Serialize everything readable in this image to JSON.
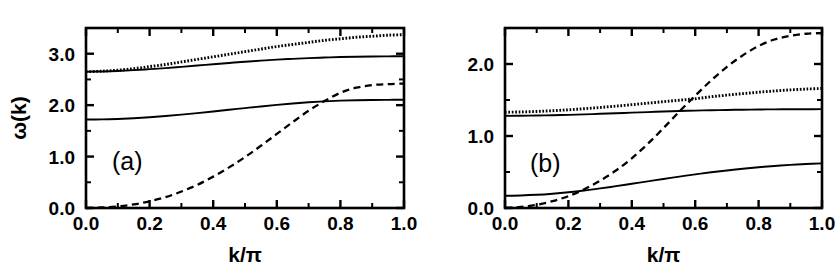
{
  "figure": {
    "background_color": "#ffffff",
    "ink_color": "#000000",
    "width": 840,
    "height": 275
  },
  "chart_data": [
    {
      "type": "line",
      "panel_label": "(a)",
      "title": "",
      "xlabel": "k/π",
      "ylabel": "ω(k)",
      "xlim": [
        0.0,
        1.0
      ],
      "ylim": [
        0.0,
        3.5
      ],
      "grid": false,
      "legend": "none",
      "xticks": [
        0.0,
        0.2,
        0.4,
        0.6,
        0.8,
        1.0
      ],
      "xticklabels": [
        "0.0",
        "0.2",
        "0.4",
        "0.6",
        "0.8",
        "1.0"
      ],
      "xminorticks": [
        0.1,
        0.3,
        0.5,
        0.7,
        0.9
      ],
      "yticks": [
        0.0,
        1.0,
        2.0,
        3.0
      ],
      "yticklabels": [
        "0.0",
        "1.0",
        "2.0",
        "3.0"
      ],
      "yminorticks": [
        0.5,
        1.5,
        2.5,
        3.5
      ],
      "x": [
        0.0,
        0.05,
        0.1,
        0.15,
        0.2,
        0.25,
        0.3,
        0.35,
        0.4,
        0.45,
        0.5,
        0.55,
        0.6,
        0.65,
        0.7,
        0.75,
        0.8,
        0.85,
        0.9,
        0.95,
        1.0
      ],
      "series": [
        {
          "name": "upper-dotted-branch",
          "style": "dotted",
          "values": [
            2.65,
            2.66,
            2.68,
            2.71,
            2.75,
            2.79,
            2.84,
            2.89,
            2.94,
            2.99,
            3.04,
            3.09,
            3.14,
            3.18,
            3.22,
            3.26,
            3.29,
            3.32,
            3.34,
            3.36,
            3.37
          ]
        },
        {
          "name": "upper-solid-branch",
          "style": "solid",
          "values": [
            2.65,
            2.655,
            2.665,
            2.68,
            2.7,
            2.72,
            2.745,
            2.77,
            2.795,
            2.82,
            2.845,
            2.865,
            2.885,
            2.9,
            2.915,
            2.925,
            2.935,
            2.942,
            2.947,
            2.949,
            2.95
          ]
        },
        {
          "name": "lower-solid-branch",
          "style": "solid",
          "values": [
            1.72,
            1.723,
            1.732,
            1.746,
            1.765,
            1.788,
            1.815,
            1.845,
            1.877,
            1.91,
            1.943,
            1.975,
            2.005,
            2.032,
            2.055,
            2.073,
            2.087,
            2.096,
            2.101,
            2.103,
            2.104
          ]
        },
        {
          "name": "dashed-dispersion-branch",
          "style": "dashed",
          "values": [
            0.0,
            0.01,
            0.03,
            0.07,
            0.13,
            0.21,
            0.32,
            0.45,
            0.61,
            0.79,
            0.99,
            1.21,
            1.44,
            1.67,
            1.89,
            2.08,
            2.24,
            2.34,
            2.39,
            2.41,
            2.42
          ]
        }
      ]
    },
    {
      "type": "line",
      "panel_label": "(b)",
      "title": "",
      "xlabel": "k/π",
      "ylabel": "",
      "xlim": [
        0.0,
        1.0
      ],
      "ylim": [
        0.0,
        2.5
      ],
      "grid": false,
      "legend": "none",
      "xticks": [
        0.0,
        0.2,
        0.4,
        0.6,
        0.8,
        1.0
      ],
      "xticklabels": [
        "0.0",
        "0.2",
        "0.4",
        "0.6",
        "0.8",
        "1.0"
      ],
      "xminorticks": [
        0.1,
        0.3,
        0.5,
        0.7,
        0.9
      ],
      "yticks": [
        0.0,
        1.0,
        2.0
      ],
      "yticklabels": [
        "0.0",
        "1.0",
        "2.0"
      ],
      "yminorticks": [
        0.5,
        1.5,
        2.5
      ],
      "x": [
        0.0,
        0.05,
        0.1,
        0.15,
        0.2,
        0.25,
        0.3,
        0.35,
        0.4,
        0.45,
        0.5,
        0.55,
        0.6,
        0.65,
        0.7,
        0.75,
        0.8,
        0.85,
        0.9,
        0.95,
        1.0
      ],
      "series": [
        {
          "name": "upper-dotted-branch",
          "style": "dotted",
          "values": [
            1.33,
            1.334,
            1.341,
            1.351,
            1.364,
            1.379,
            1.396,
            1.415,
            1.435,
            1.456,
            1.477,
            1.497,
            1.517,
            1.545,
            1.568,
            1.589,
            1.608,
            1.625,
            1.64,
            1.652,
            1.66
          ]
        },
        {
          "name": "flat-solid-branch",
          "style": "solid",
          "values": [
            1.28,
            1.281,
            1.284,
            1.288,
            1.294,
            1.3,
            1.308,
            1.316,
            1.324,
            1.332,
            1.34,
            1.347,
            1.353,
            1.358,
            1.362,
            1.365,
            1.368,
            1.37,
            1.371,
            1.372,
            1.373
          ]
        },
        {
          "name": "lower-solid-branch",
          "style": "solid",
          "values": [
            0.17,
            0.174,
            0.183,
            0.198,
            0.218,
            0.243,
            0.272,
            0.303,
            0.336,
            0.37,
            0.403,
            0.436,
            0.467,
            0.496,
            0.521,
            0.545,
            0.566,
            0.584,
            0.599,
            0.611,
            0.62
          ]
        },
        {
          "name": "dashed-dispersion-branch",
          "style": "dashed",
          "values": [
            0.0,
            0.015,
            0.045,
            0.095,
            0.165,
            0.26,
            0.38,
            0.52,
            0.69,
            0.89,
            1.11,
            1.34,
            1.56,
            1.77,
            1.96,
            2.12,
            2.25,
            2.34,
            2.39,
            2.42,
            2.43
          ]
        }
      ]
    }
  ],
  "panel_a": {
    "tag": "(a)",
    "xlabel": "k/π",
    "ylabel": "ω(k)",
    "xticklabels": [
      "0.0",
      "0.2",
      "0.4",
      "0.6",
      "0.8",
      "1.0"
    ],
    "yticklabels": [
      "0.0",
      "1.0",
      "2.0",
      "3.0"
    ]
  },
  "panel_b": {
    "tag": "(b)",
    "xlabel": "k/π",
    "ylabel": "",
    "xticklabels": [
      "0.0",
      "0.2",
      "0.4",
      "0.6",
      "0.8",
      "1.0"
    ],
    "yticklabels": [
      "0.0",
      "1.0",
      "2.0"
    ]
  }
}
